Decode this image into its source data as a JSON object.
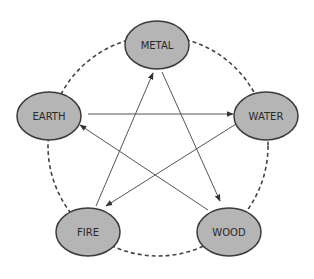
{
  "diagram": {
    "type": "five-elements-cycle",
    "colors": {
      "node_fill": "#b5b5b5",
      "node_stroke": "#3a3a3a",
      "edge": "#555555",
      "cycle": "#444444"
    },
    "nodes": [
      {
        "id": "metal",
        "label": "METAL",
        "cx": 157,
        "cy": 45
      },
      {
        "id": "water",
        "label": "WATER",
        "cx": 266,
        "cy": 116
      },
      {
        "id": "wood",
        "label": "WOOD",
        "cx": 229,
        "cy": 232
      },
      {
        "id": "fire",
        "label": "FIRE",
        "cx": 88,
        "cy": 232
      },
      {
        "id": "earth",
        "label": "EARTH",
        "cx": 49,
        "cy": 116
      }
    ],
    "cycle": {
      "style": "dashed",
      "connects": [
        "metal",
        "water",
        "wood",
        "fire",
        "earth"
      ]
    },
    "arrows": [
      {
        "from": "fire",
        "to": "metal"
      },
      {
        "from": "metal",
        "to": "wood"
      },
      {
        "from": "wood",
        "to": "earth"
      },
      {
        "from": "earth",
        "to": "water"
      },
      {
        "from": "water",
        "to": "fire"
      }
    ]
  }
}
